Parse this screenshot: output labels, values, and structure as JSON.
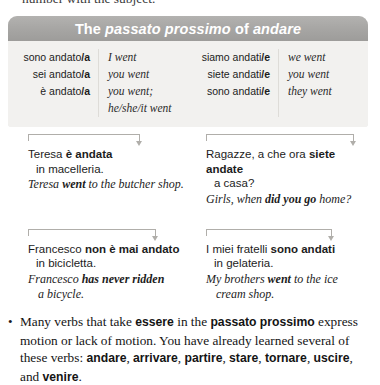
{
  "clipped_previous_line": "number with the subject.",
  "panel": {
    "title_parts": {
      "lead": "The ",
      "term": "passato prossimo",
      "mid": " of ",
      "verb": "andare"
    },
    "title_full": "The passato prossimo of andare",
    "singular": [
      {
        "italian_stem": "sono andato",
        "italian_suffix": "/a",
        "english": "I went"
      },
      {
        "italian_stem": "sei andato",
        "italian_suffix": "/a",
        "english": "you went"
      },
      {
        "italian_stem": "è andato",
        "italian_suffix": "/a",
        "english": "you went;",
        "english2": "he/she/it went"
      }
    ],
    "plural": [
      {
        "italian_stem": "siamo andati",
        "italian_suffix": "/e",
        "english": "we went"
      },
      {
        "italian_stem": "siete andati",
        "italian_suffix": "/e",
        "english": "you went"
      },
      {
        "italian_stem": "sono andati",
        "italian_suffix": "/e",
        "english": "they went"
      }
    ]
  },
  "examples": [
    {
      "it_pre": "Teresa ",
      "it_bold": "è andata",
      "it_line2": "in macelleria.",
      "en_pre": "Teresa ",
      "en_bold": "went",
      "en_post": " to the butcher shop.",
      "en_line2": ""
    },
    {
      "it_pre": "Ragazze, a che ora ",
      "it_bold": "siete andate",
      "it_line2": "a casa?",
      "en_pre": "Girls, when ",
      "en_bold": "did you go",
      "en_post": " home?",
      "en_line2": ""
    },
    {
      "it_pre": "Francesco ",
      "it_bold": "non è mai andato",
      "it_line2": "in bicicletta.",
      "en_pre": "Francesco ",
      "en_bold": "has never ridden",
      "en_post": "",
      "en_line2": "a bicycle."
    },
    {
      "it_pre": "I miei fratelli ",
      "it_bold": "sono andati",
      "it_line2": "in gelateria.",
      "en_pre": "My brothers ",
      "en_bold": "went",
      "en_post": " to the ice",
      "en_line2": "cream shop."
    }
  ],
  "bullet": {
    "marker": "•",
    "seg1": "Many verbs that take ",
    "b1": "essere",
    "seg2": " in the ",
    "b2": "passato prossimo",
    "seg3": " express motion or lack of motion. You have already learned several of these verbs: ",
    "verbs": [
      "andare",
      "arrivare",
      "partire",
      "stare",
      "tornare",
      "uscire"
    ],
    "seg4": ", and ",
    "b_last": "venire",
    "seg5": "."
  },
  "colors": {
    "header_gray": "#a8a7a5",
    "panel_body": "#f2f1ef",
    "divider": "#dedcd8",
    "bracket": "#b0aeaa",
    "text": "#1a1a1a"
  }
}
